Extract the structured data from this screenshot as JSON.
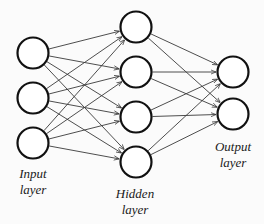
{
  "diagram": {
    "colors": {
      "background": "#fbfbfb",
      "node_fill": "#ffffff",
      "node_stroke": "#111111",
      "edge": "#3a3a3a",
      "text": "#1a1a1a"
    },
    "node_radius": 15.5,
    "layers": [
      {
        "id": "input",
        "label_line1": "Input",
        "label_line2": "layer",
        "label_pos": {
          "x": 33,
          "y": 166
        },
        "nodes": [
          {
            "x": 33,
            "y": 53
          },
          {
            "x": 33,
            "y": 98
          },
          {
            "x": 33,
            "y": 143
          }
        ]
      },
      {
        "id": "hidden",
        "label_line1": "Hidden",
        "label_line2": "layer",
        "label_pos": {
          "x": 135,
          "y": 186
        },
        "nodes": [
          {
            "x": 136,
            "y": 27
          },
          {
            "x": 136,
            "y": 72
          },
          {
            "x": 136,
            "y": 117
          },
          {
            "x": 136,
            "y": 162
          }
        ]
      },
      {
        "id": "output",
        "label_line1": "Output",
        "label_line2": "layer",
        "label_pos": {
          "x": 233,
          "y": 139
        },
        "nodes": [
          {
            "x": 233,
            "y": 72
          },
          {
            "x": 233,
            "y": 114
          }
        ]
      }
    ],
    "connections": "fully-connected between consecutive layers, arrows pointing forward"
  }
}
